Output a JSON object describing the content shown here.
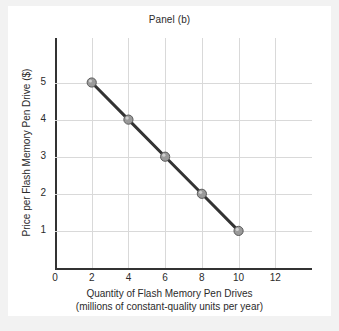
{
  "chart_data": {
    "type": "line",
    "title": "Panel (b)",
    "xlabel": "Quantity of Flash Memory Pen Drives",
    "xlabel_sub": "(millions of constant-quality units per year)",
    "ylabel": "Price per Flash Memory Pen Drive ($)",
    "x": [
      2,
      4,
      6,
      8,
      10
    ],
    "values": [
      5,
      4,
      3,
      2,
      1
    ],
    "series": [
      {
        "name": "Demand",
        "x": [
          2,
          4,
          6,
          8,
          10
        ],
        "values": [
          5,
          4,
          3,
          2,
          1
        ]
      }
    ],
    "xticks": [
      0,
      2,
      4,
      6,
      8,
      10,
      12
    ],
    "yticks": [
      1,
      2,
      3,
      4,
      5
    ],
    "xlim": [
      0,
      14
    ],
    "ylim": [
      0,
      6.2
    ],
    "grid": true,
    "legend": null,
    "line_color": "#333333",
    "marker_color": "#9a9a9a",
    "marker_edge_color": "#5a5a5a",
    "grid_color": "#d9d9d9",
    "axis_color": "#333333",
    "background_color": "#ffffff",
    "frame_color": "#f2f2f2"
  }
}
